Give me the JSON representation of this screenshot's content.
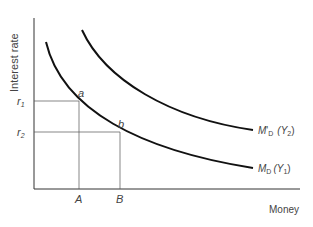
{
  "diagram": {
    "y_axis_label": "Interest rate",
    "x_axis_label": "Money",
    "y_ticks": [
      {
        "main": "r",
        "sub": "1"
      },
      {
        "main": "r",
        "sub": "2"
      }
    ],
    "x_ticks": [
      "A",
      "B"
    ],
    "points": [
      "a",
      "b"
    ],
    "curves": [
      {
        "name": "M",
        "prime": "'",
        "sub": "D",
        "arg": "(Y",
        "arg_sub": "2",
        "close": ")"
      },
      {
        "name": "M",
        "prime": "",
        "sub": "D",
        "arg": "(Y",
        "arg_sub": "1",
        "close": ")"
      }
    ]
  }
}
